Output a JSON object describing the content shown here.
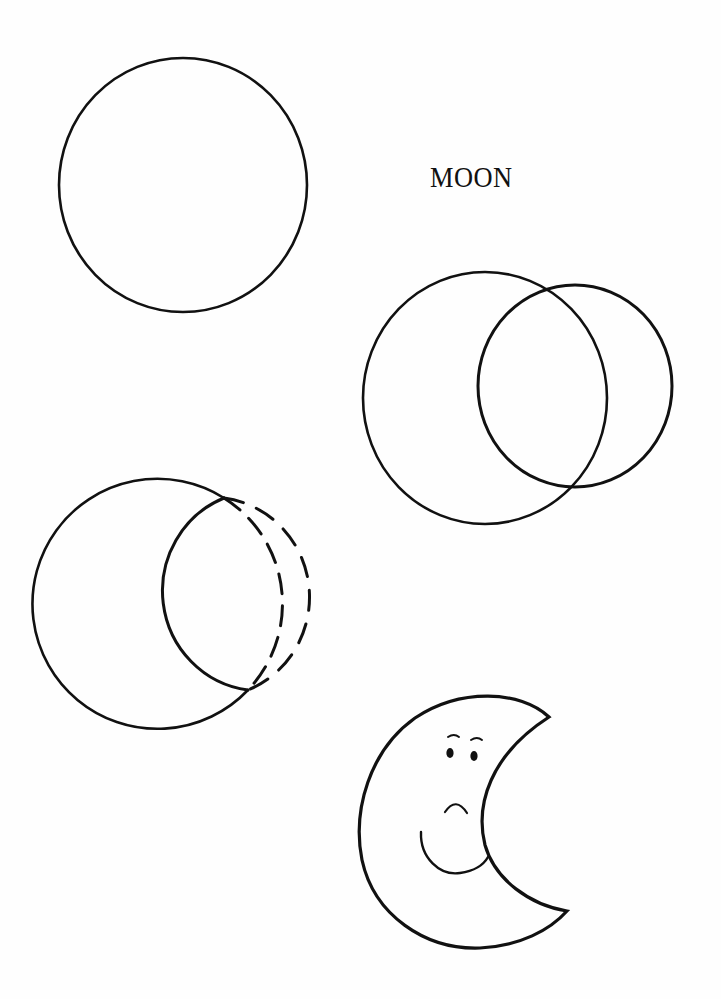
{
  "title": "MOON",
  "colors": {
    "ink": "#111111",
    "paper": "#fefefe"
  },
  "steps": [
    {
      "id": 1,
      "description": "Single circle"
    },
    {
      "id": 2,
      "description": "Two overlapping circles"
    },
    {
      "id": 3,
      "description": "Crescent with dashed guide circle"
    },
    {
      "id": 4,
      "description": "Finished crescent moon with face"
    }
  ]
}
